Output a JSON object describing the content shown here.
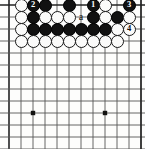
{
  "diagram": {
    "type": "go-board",
    "board": {
      "cols": 12,
      "rows": 13,
      "origin_x": 9,
      "origin_y": 5,
      "spacing": 12,
      "line_color": "#555555",
      "border_color": "#222222",
      "background": "#fdfdfc",
      "star_points": [
        {
          "col": 2,
          "row": 9
        },
        {
          "col": 8,
          "row": 9
        }
      ]
    },
    "colors": {
      "black_stone": "#111111",
      "white_stone": "#fbfbfa",
      "stone_outline": "#1a1a1a",
      "black_number_text": "#ffffff",
      "white_number_text": "#111111",
      "point_label_text": "#111111"
    },
    "stones": [
      {
        "col": 1,
        "row": 0,
        "color": "white",
        "label": ""
      },
      {
        "col": 2,
        "row": 0,
        "color": "black",
        "label": "2"
      },
      {
        "col": 3,
        "row": 0,
        "color": "black",
        "label": ""
      },
      {
        "col": 5,
        "row": 0,
        "color": "black",
        "label": ""
      },
      {
        "col": 7,
        "row": 0,
        "color": "black",
        "label": "1"
      },
      {
        "col": 8,
        "row": 0,
        "color": "white",
        "label": ""
      },
      {
        "col": 10,
        "row": 0,
        "color": "black",
        "label": "3"
      },
      {
        "col": 1,
        "row": 1,
        "color": "white",
        "label": ""
      },
      {
        "col": 2,
        "row": 1,
        "color": "black",
        "label": ""
      },
      {
        "col": 3,
        "row": 1,
        "color": "white",
        "label": ""
      },
      {
        "col": 4,
        "row": 1,
        "color": "white",
        "label": ""
      },
      {
        "col": 5,
        "row": 1,
        "color": "white",
        "label": ""
      },
      {
        "col": 7,
        "row": 1,
        "color": "black",
        "label": ""
      },
      {
        "col": 8,
        "row": 1,
        "color": "white",
        "label": ""
      },
      {
        "col": 9,
        "row": 1,
        "color": "black",
        "label": ""
      },
      {
        "col": 10,
        "row": 1,
        "color": "white",
        "label": ""
      },
      {
        "col": 1,
        "row": 2,
        "color": "white",
        "label": ""
      },
      {
        "col": 2,
        "row": 2,
        "color": "black",
        "label": ""
      },
      {
        "col": 3,
        "row": 2,
        "color": "black",
        "label": ""
      },
      {
        "col": 4,
        "row": 2,
        "color": "black",
        "label": ""
      },
      {
        "col": 5,
        "row": 2,
        "color": "black",
        "label": ""
      },
      {
        "col": 6,
        "row": 2,
        "color": "black",
        "label": ""
      },
      {
        "col": 7,
        "row": 2,
        "color": "black",
        "label": ""
      },
      {
        "col": 8,
        "row": 2,
        "color": "black",
        "label": ""
      },
      {
        "col": 9,
        "row": 2,
        "color": "white",
        "label": ""
      },
      {
        "col": 10,
        "row": 2,
        "color": "white",
        "label": "4"
      },
      {
        "col": 1,
        "row": 3,
        "color": "white",
        "label": ""
      },
      {
        "col": 2,
        "row": 3,
        "color": "white",
        "label": ""
      },
      {
        "col": 3,
        "row": 3,
        "color": "white",
        "label": ""
      },
      {
        "col": 4,
        "row": 3,
        "color": "white",
        "label": ""
      },
      {
        "col": 5,
        "row": 3,
        "color": "white",
        "label": ""
      },
      {
        "col": 6,
        "row": 3,
        "color": "white",
        "label": ""
      },
      {
        "col": 7,
        "row": 3,
        "color": "white",
        "label": ""
      },
      {
        "col": 8,
        "row": 3,
        "color": "white",
        "label": ""
      },
      {
        "col": 9,
        "row": 3,
        "color": "white",
        "label": ""
      }
    ],
    "point_labels": [
      {
        "col": 6,
        "row": 1,
        "text": "a"
      }
    ]
  }
}
